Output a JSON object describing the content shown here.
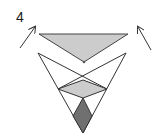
{
  "figure": {
    "label": "4",
    "colors": {
      "stroke": "#333333",
      "light_fill": "#cccccc",
      "dark_fill": "#707070",
      "background": "#ffffff"
    },
    "shapes": {
      "top_triangle": {
        "points": "39,34 128,34 84,62",
        "fill": "light_fill"
      },
      "outer_v": {
        "points": "38,53 83,133 126,53"
      },
      "cross_left": {
        "from": [
          38,
          53
        ],
        "to": [
          107,
          89
        ]
      },
      "cross_right": {
        "from": [
          126,
          53
        ],
        "to": [
          58,
          89
        ]
      },
      "light_diamond": {
        "points": "83,80 107,89 83,98 58,89",
        "fill": "light_fill"
      },
      "dark_diamond": {
        "points": "83,98 92,116 83,133 73,116",
        "fill": "dark_fill"
      }
    },
    "arrows": [
      {
        "name": "left-arrow",
        "from": [
          20,
          48
        ],
        "to": [
          35,
          27
        ]
      },
      {
        "name": "right-arrow",
        "from": [
          151,
          50
        ],
        "to": [
          138,
          27
        ]
      }
    ]
  }
}
